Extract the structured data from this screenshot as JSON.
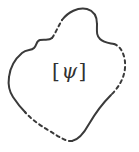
{
  "figure": {
    "kind": "closed-region-diagram",
    "canvas": {
      "width": 139,
      "height": 152
    },
    "background_color": "#ffffff",
    "stroke_color": "#3a3a3a",
    "stroke_width": 2,
    "label": {
      "full_text": "[ψ]",
      "open_bracket": "[",
      "symbol": "ψ",
      "close_bracket": "]",
      "symbol_name": "psi",
      "style": "italic-serif",
      "color": "#313131",
      "font_size_px": 20,
      "center_x": 74,
      "center_y": 71
    },
    "boundary": {
      "closed": true,
      "bounding_box": {
        "x_min": 8,
        "y_min": 8,
        "x_max": 126,
        "y_max": 146
      },
      "dash_pattern": "3.2 3.6",
      "segments": [
        {
          "id": "top-arc-solid",
          "style": "solid",
          "description": "top crest running from upper-left dashed break rightwards over the crown",
          "path": "M 62,20 C 68,12 78,7 87,9 C 94,11 97,16 97,24"
        },
        {
          "id": "top-right-shoulder-solid",
          "style": "solid",
          "description": "sharp shoulder at top right then sweep down to the right flank",
          "path": "M 97,24 C 97,31 96,35 100,39 C 104,43 110,43 114,44"
        },
        {
          "id": "right-flank-dashed",
          "style": "dashed",
          "description": "dashed right side bulging outward toward the right margin",
          "path": "M 114,44 C 121,46 126,56 125,68 C 124,80 117,89 111,95"
        },
        {
          "id": "bottom-right-solid",
          "style": "solid",
          "description": "solid S-curve along the bottom right, hooking left to the base",
          "path": "M 111,95 C 104,102 96,112 89,124 C 84,133 78,140 72,141"
        },
        {
          "id": "bottom-left-dashed",
          "style": "dashed",
          "description": "dashed bottom-left run sweeping back up to the lower left flank",
          "path": "M 72,141 C 66,142 58,136 48,130 C 38,124 30,118 25,112"
        },
        {
          "id": "left-lower-solid",
          "style": "solid",
          "description": "solid lower-left flank rising from the bottom notch",
          "path": "M 25,112 C 20,107 17,103 13,97 C 9,91 8,84 9,77"
        },
        {
          "id": "left-upper-solid",
          "style": "solid",
          "description": "solid upper-left flank with a small S-shaped notch",
          "path": "M 9,77 C 10,68 15,59 22,53 C 27,49 31,51 34,48 C 37,45 36,41 40,40 C 45,39 49,41 52,38"
        },
        {
          "id": "upper-left-dashed",
          "style": "dashed",
          "description": "short dashed diagonal climbing from the left notch to the top crest",
          "path": "M 52,38 C 55,34 58,27 62,20"
        }
      ]
    }
  }
}
